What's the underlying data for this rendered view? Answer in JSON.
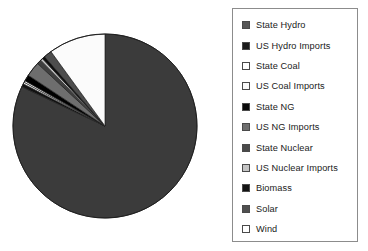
{
  "chart_data": {
    "type": "pie",
    "title": "",
    "legend_position": "right",
    "grid": false,
    "start_angle_deg": 90,
    "direction": "clockwise",
    "categories": [
      "State Hydro",
      "US Hydro Imports",
      "State Coal",
      "US Coal Imports",
      "State NG",
      "US NG Imports",
      "State Nuclear",
      "US Nuclear Imports",
      "Biomass",
      "Solar",
      "Wind"
    ],
    "values": [
      82.0,
      0.6,
      0.3,
      0.3,
      1.1,
      2.6,
      0.8,
      0.4,
      0.5,
      1.4,
      10.0
    ],
    "units": "percent",
    "colors": [
      "#3b3b3b",
      "#111111",
      "#ffffff",
      "#f2f2f2",
      "#000000",
      "#6e6e6e",
      "#3f3f3f",
      "#c9c9c9",
      "#0d0d0d",
      "#4d4d4d",
      "#fbfbfb"
    ],
    "slices": [
      {
        "label": "State Hydro",
        "value": 82.0,
        "color": "#3b3b3b",
        "swatch": "#575757"
      },
      {
        "label": "US Hydro Imports",
        "value": 0.6,
        "color": "#111111",
        "swatch": "#1b1b1b"
      },
      {
        "label": "State Coal",
        "value": 0.3,
        "color": "#ffffff",
        "swatch": "#ffffff"
      },
      {
        "label": "US Coal Imports",
        "value": 0.3,
        "color": "#f2f2f2",
        "swatch": "#fafafa"
      },
      {
        "label": "State NG",
        "value": 1.1,
        "color": "#000000",
        "swatch": "#0a0a0a"
      },
      {
        "label": "US NG Imports",
        "value": 2.6,
        "color": "#6e6e6e",
        "swatch": "#6e6e6e"
      },
      {
        "label": "State Nuclear",
        "value": 0.8,
        "color": "#3f3f3f",
        "swatch": "#4a4a4a"
      },
      {
        "label": "US Nuclear Imports",
        "value": 0.4,
        "color": "#c9c9c9",
        "swatch": "#c4c4c4"
      },
      {
        "label": "Biomass",
        "value": 0.5,
        "color": "#0d0d0d",
        "swatch": "#131313"
      },
      {
        "label": "Solar",
        "value": 1.4,
        "color": "#4d4d4d",
        "swatch": "#4f4f4f"
      },
      {
        "label": "Wind",
        "value": 10.0,
        "color": "#fbfbfb",
        "swatch": "#ffffff"
      }
    ]
  },
  "legend": {
    "items": [
      {
        "label": "State Hydro"
      },
      {
        "label": "US Hydro Imports"
      },
      {
        "label": "State Coal"
      },
      {
        "label": "US Coal Imports"
      },
      {
        "label": "State NG"
      },
      {
        "label": "US NG Imports"
      },
      {
        "label": "State Nuclear"
      },
      {
        "label": "US Nuclear Imports"
      },
      {
        "label": "Biomass"
      },
      {
        "label": "Solar"
      },
      {
        "label": "Wind"
      }
    ]
  },
  "style": {
    "background": "#ffffff",
    "legend_border": "#8c8c8c",
    "text_color": "#1a1a1a",
    "pie_outline": "#222222"
  },
  "pie_geometry": {
    "cx": 105,
    "cy": 126,
    "r": 92
  }
}
